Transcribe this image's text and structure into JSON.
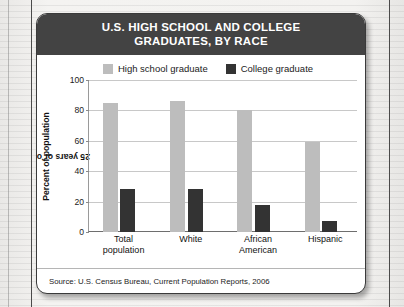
{
  "header": {
    "title_line1": "U.S. HIGH SCHOOL AND COLLEGE",
    "title_line2": "GRADUATES, BY RACE",
    "background_color": "#434343",
    "text_color": "#ffffff"
  },
  "source": {
    "text": "Source: U.S. Census Bureau, Current Population Reports, 2006"
  },
  "chart_data": {
    "type": "bar",
    "title": "U.S. HIGH SCHOOL AND COLLEGE GRADUATES, BY RACE",
    "categories": [
      "Total population",
      "White",
      "African American",
      "Hispanic"
    ],
    "category_lines": [
      {
        "l1": "Total",
        "l2": "population"
      },
      {
        "l1": "White",
        "l2": ""
      },
      {
        "l1": "African",
        "l2": "American"
      },
      {
        "l1": "Hispanic",
        "l2": ""
      }
    ],
    "series": [
      {
        "name": "High school graduate",
        "values": [
          85,
          86,
          80,
          59
        ],
        "color": "#bdbdbd"
      },
      {
        "name": "College graduate",
        "values": [
          28,
          28,
          18,
          7
        ],
        "color": "#333333"
      }
    ],
    "xlabel": "",
    "ylabel": "Percent of population 25 years or over",
    "ylabel_line1": "Percent of population",
    "ylabel_line2": "25 years or over",
    "ylim": [
      0,
      100
    ],
    "yticks": [
      100,
      80,
      60,
      40,
      20,
      0
    ],
    "ytick_labels": [
      "100",
      "80",
      "60",
      "40",
      "20",
      "0"
    ],
    "grid": true,
    "legend_position": "top-center"
  }
}
